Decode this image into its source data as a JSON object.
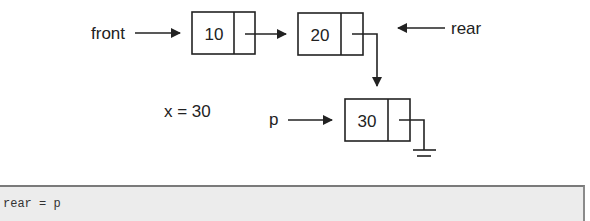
{
  "diagram": {
    "type": "linked-list-queue",
    "pointers": {
      "front": "front",
      "rear": "rear",
      "p": "p"
    },
    "variable": "x = 30",
    "nodes": [
      {
        "value": "10"
      },
      {
        "value": "20"
      },
      {
        "value": "30"
      }
    ],
    "colors": {
      "stroke": "#222222",
      "code_bg": "#ececec"
    }
  },
  "code": {
    "line": "rear = p"
  }
}
